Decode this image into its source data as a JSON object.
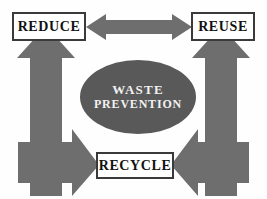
{
  "diagram": {
    "type": "waste-management-hierarchy-cycle",
    "background_color": "#fefefe",
    "arrow_color": "#6e6e6e",
    "ellipse_color": "#595959",
    "box_border_color": "#3a3a3a",
    "box_fill_color": "#ffffff",
    "box_text_color": "#121212",
    "ellipse_text_color": "#f2f2f2",
    "nodes": {
      "reduce": {
        "label": "REDUCE"
      },
      "reuse": {
        "label": "REUSE"
      },
      "recycle": {
        "label": "RECYCLE"
      }
    },
    "center": {
      "line1": "WASTE",
      "line2": "PREVENTION"
    },
    "arrows": [
      {
        "name": "reduce-reuse-bidirectional",
        "direction": "both",
        "orientation": "horizontal"
      },
      {
        "name": "left-up-to-reduce",
        "direction": "up",
        "orientation": "vertical"
      },
      {
        "name": "right-up-to-reuse",
        "direction": "up",
        "orientation": "vertical"
      },
      {
        "name": "left-right-into-recycle",
        "direction": "right",
        "orientation": "horizontal"
      },
      {
        "name": "right-left-into-recycle",
        "direction": "left",
        "orientation": "horizontal"
      }
    ]
  }
}
